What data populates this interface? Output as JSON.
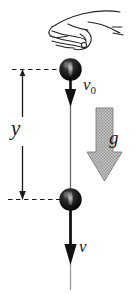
{
  "figure": {
    "background_color": "#ffffff",
    "ink_color": "#1a1a1a",
    "ball_color": "#111111",
    "gravity_arrow_color": "#a8a8a8"
  },
  "labels": {
    "initial_velocity": "v",
    "initial_velocity_subscript": "0",
    "displacement": "y",
    "gravity": "g",
    "final_velocity": "v"
  },
  "elements": {
    "hand": "hand-releasing-ball",
    "ball_top": "ball-at-release",
    "ball_bottom": "ball-after-fall",
    "velocity_arrow_top": "downward-velocity-arrow",
    "velocity_arrow_bottom": "downward-velocity-arrow",
    "gravity_arrow": "hatched-downward-gravity-arrow",
    "dashed_line_top": "reference-level-upper",
    "dashed_line_bottom": "reference-level-lower",
    "dimension_line": "drop-distance-dimension"
  }
}
